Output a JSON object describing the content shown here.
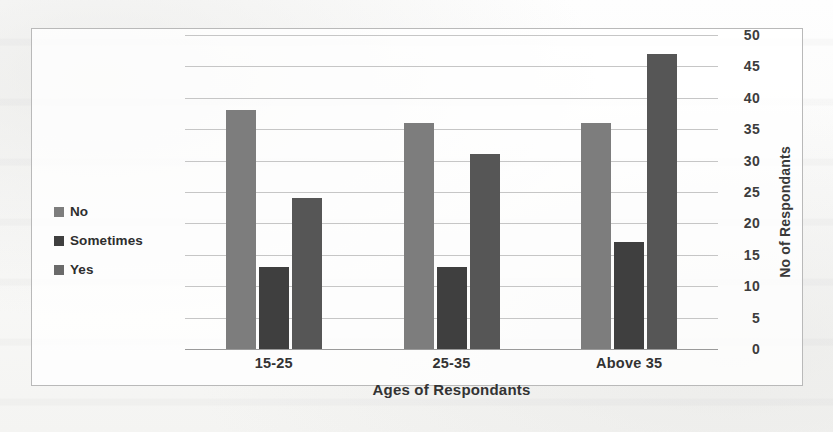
{
  "chart_data": {
    "type": "bar",
    "title": "",
    "categories": [
      "15-25",
      "25-35",
      "Above 35"
    ],
    "series": [
      {
        "name": "No",
        "color": "#7d7d7d",
        "values": [
          38,
          36,
          36
        ]
      },
      {
        "name": "Sometimes",
        "color": "#3f3f3f",
        "values": [
          13,
          13,
          17
        ]
      },
      {
        "name": "Yes",
        "color": "#565656",
        "values": [
          24,
          31,
          47
        ]
      }
    ],
    "xlabel": "Ages of Respondants",
    "ylabel": "No of Respondants",
    "ylim": [
      0,
      50
    ],
    "ytick_step": 5,
    "yticks": [
      50,
      45,
      40,
      35,
      30,
      25,
      20,
      15,
      10,
      5,
      0
    ],
    "grid": true,
    "grid_axis": "y",
    "legend_position": "left-middle",
    "y_axis_side": "right"
  },
  "legend": {
    "items": [
      {
        "label": "No"
      },
      {
        "label": "Sometimes"
      },
      {
        "label": "Yes"
      }
    ]
  },
  "axes": {
    "x_title": "Ages of Respondants",
    "y_title": "No of Respondants",
    "x_categories": [
      "15-25",
      "25-35",
      "Above 35"
    ],
    "y_ticks": [
      "50",
      "45",
      "40",
      "35",
      "30",
      "25",
      "20",
      "15",
      "10",
      "5",
      "0"
    ]
  },
  "colors": {
    "border": "#b9b9b9",
    "gridline": "#c6c6c6",
    "baseline": "#9a9a9a",
    "series_no": "#7d7d7d",
    "series_sometimes": "#3f3f3f",
    "series_yes": "#565656",
    "text": "#333333",
    "page": "#fdfdfc"
  }
}
